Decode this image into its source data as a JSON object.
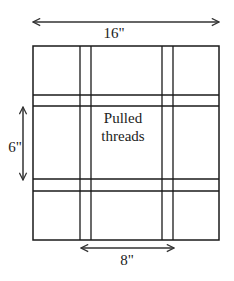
{
  "diagram": {
    "dimensions": {
      "width_label": "16\"",
      "height_label": "6\"",
      "gap_label": "8\""
    },
    "center_label_line1": "Pulled",
    "center_label_line2": "threads",
    "colors": {
      "line": "#1a1a1a",
      "arrow": "#333333",
      "background": "#ffffff"
    }
  }
}
